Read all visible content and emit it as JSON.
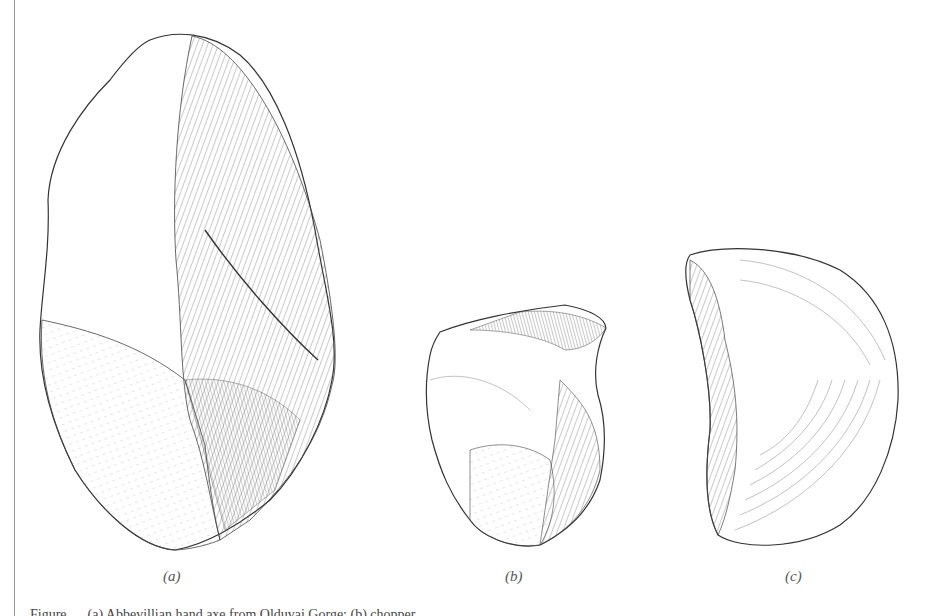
{
  "figure": {
    "labels": {
      "a": "(a)",
      "b": "(b)",
      "c": "(c)"
    },
    "caption": "Figure … (a) Abbevillian hand axe from Olduvai Gorge; (b) chopper …",
    "items": [
      {
        "id": "a",
        "description": "large bifacial hand axe, flaked surface on right side"
      },
      {
        "id": "b",
        "description": "small flaked stone tool"
      },
      {
        "id": "c",
        "description": "flake tool with curved ripple marks"
      }
    ],
    "colors": {
      "line": "#333333",
      "background": "#ffffff",
      "border": "#9a9a9a"
    }
  }
}
